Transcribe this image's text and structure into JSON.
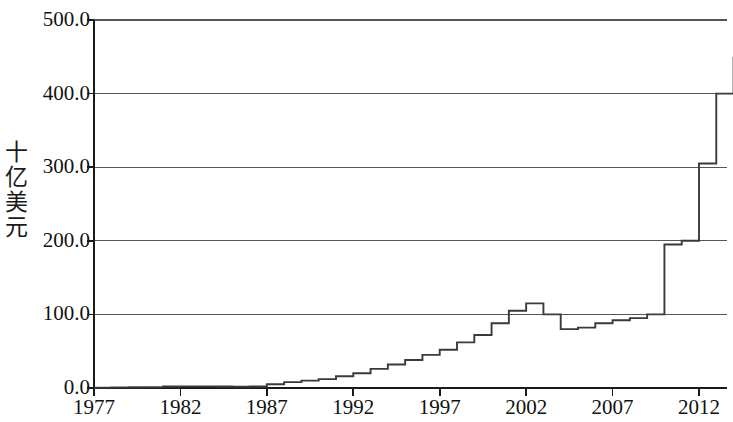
{
  "chart_data": {
    "type": "line",
    "title": "",
    "xlabel": "",
    "ylabel": "十亿美元",
    "ylabel_chars": [
      "十",
      "亿",
      "美",
      "元"
    ],
    "xlim": [
      1977,
      2014
    ],
    "ylim": [
      0.0,
      500.0
    ],
    "ytick_labels": [
      "500.0",
      "400.0",
      "300.0",
      "200.0",
      "100.0",
      "0.0"
    ],
    "ytick_values": [
      500.0,
      400.0,
      300.0,
      200.0,
      100.0,
      0.0
    ],
    "xtick_labels": [
      "1977",
      "1982",
      "1987",
      "1992",
      "1997",
      "2002",
      "2007",
      "2012"
    ],
    "xtick_values": [
      1977,
      1982,
      1987,
      1992,
      1997,
      2002,
      2007,
      2012
    ],
    "grid": "horizontal",
    "legend": "none",
    "line_color": "#3a3a3a",
    "axis_color": "#1a1a1a",
    "grid_color": "#555555",
    "x": [
      1977,
      1978,
      1979,
      1980,
      1981,
      1982,
      1983,
      1984,
      1985,
      1986,
      1987,
      1988,
      1989,
      1990,
      1991,
      1992,
      1993,
      1994,
      1995,
      1996,
      1997,
      1998,
      1999,
      2000,
      2001,
      2002,
      2003,
      2004,
      2005,
      2006,
      2007,
      2008,
      2009,
      2010,
      2011,
      2012,
      2013,
      2014
    ],
    "values": [
      0.5,
      0.8,
      1.0,
      1.2,
      2.0,
      2.2,
      2.2,
      2.0,
      1.8,
      2.0,
      5.0,
      8.0,
      10.0,
      12.0,
      16.0,
      20.0,
      26.0,
      32.0,
      38.0,
      45.0,
      52.0,
      62.0,
      72.0,
      88.0,
      105.0,
      115.0,
      100.0,
      80.0,
      82.0,
      88.0,
      92.0,
      95.0,
      100.0,
      195.0,
      200.0,
      305.0,
      400.0,
      450.0
    ]
  }
}
